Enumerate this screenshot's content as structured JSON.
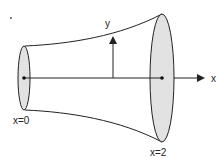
{
  "diagram": {
    "labels": {
      "y_axis": "y",
      "x_axis": "x",
      "left_end": "x=0",
      "right_end": "x=2"
    },
    "colors": {
      "stroke": "#222222",
      "disk_fill": "#e2e2e2",
      "background": "#ffffff"
    }
  }
}
